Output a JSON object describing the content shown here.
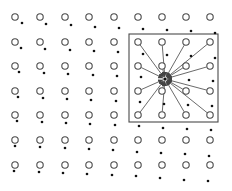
{
  "diagram": {
    "colors": {
      "background": "#ffffff",
      "stroke": "#4a4a4a",
      "dot": "#111111",
      "arrow": "#444444"
    },
    "grid": {
      "columns_x": [
        15,
        40,
        65,
        89,
        114,
        138,
        162,
        186,
        210
      ],
      "rows_y": [
        17,
        42,
        66,
        91,
        115,
        140,
        165
      ],
      "circle_radius": 3.2
    },
    "dots": [
      [
        [
          22,
          23
        ],
        [
          46,
          24
        ],
        [
          71,
          25
        ],
        [
          95,
          27
        ],
        [
          119,
          28
        ],
        [
          143,
          29
        ],
        [
          167,
          30
        ],
        [
          191,
          31
        ],
        [
          215,
          33
        ]
      ],
      [
        [
          21,
          48
        ],
        [
          45,
          49
        ],
        [
          70,
          50
        ],
        [
          94,
          51
        ],
        [
          118,
          52
        ],
        [
          143,
          54
        ],
        [
          167,
          55
        ],
        [
          191,
          56
        ],
        [
          215,
          58
        ]
      ],
      [
        [
          19,
          72
        ],
        [
          44,
          73
        ],
        [
          68,
          74
        ],
        [
          93,
          75
        ],
        [
          117,
          76
        ],
        [
          141,
          77
        ],
        [
          165,
          79
        ],
        [
          189,
          80
        ],
        [
          213,
          81
        ]
      ],
      [
        [
          18,
          97
        ],
        [
          43,
          98
        ],
        [
          67,
          99
        ],
        [
          91,
          100
        ],
        [
          116,
          101
        ],
        [
          140,
          102
        ],
        [
          164,
          104
        ],
        [
          188,
          105
        ],
        [
          212,
          106
        ]
      ],
      [
        [
          17,
          121
        ],
        [
          42,
          122
        ],
        [
          66,
          123
        ],
        [
          90,
          124
        ],
        [
          115,
          125
        ],
        [
          139,
          126
        ],
        [
          163,
          128
        ],
        [
          187,
          129
        ],
        [
          211,
          130
        ]
      ],
      [
        [
          15,
          146
        ],
        [
          40,
          147
        ],
        [
          65,
          148
        ],
        [
          89,
          149
        ],
        [
          113,
          150
        ],
        [
          137,
          152
        ],
        [
          161,
          153
        ],
        [
          185,
          154
        ],
        [
          209,
          156
        ]
      ],
      [
        [
          14,
          171
        ],
        [
          39,
          172
        ],
        [
          63,
          173
        ],
        [
          87,
          174
        ],
        [
          112,
          175
        ],
        [
          136,
          176
        ],
        [
          160,
          178
        ],
        [
          184,
          180
        ],
        [
          208,
          181
        ]
      ]
    ],
    "box": {
      "x": 129,
      "y": 34,
      "width": 89,
      "height": 88
    },
    "convergence_point": [
      165,
      79
    ],
    "arrow_sources": [
      [
        138,
        42
      ],
      [
        162,
        42
      ],
      [
        186,
        42
      ],
      [
        210,
        42
      ],
      [
        138,
        66
      ],
      [
        162,
        66
      ],
      [
        186,
        66
      ],
      [
        210,
        66
      ],
      [
        138,
        91
      ],
      [
        162,
        91
      ],
      [
        186,
        91
      ],
      [
        210,
        91
      ],
      [
        138,
        115
      ],
      [
        162,
        115
      ],
      [
        186,
        115
      ],
      [
        210,
        115
      ]
    ]
  }
}
